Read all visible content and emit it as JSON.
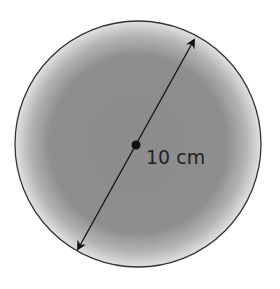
{
  "diagram": {
    "shape": "circle",
    "diameter_label": "10 cm",
    "colors": {
      "fill_center": "#8a8a8a",
      "fill_edge": "#d8d8d8",
      "outline": "#333333",
      "arrow": "#111111"
    }
  }
}
